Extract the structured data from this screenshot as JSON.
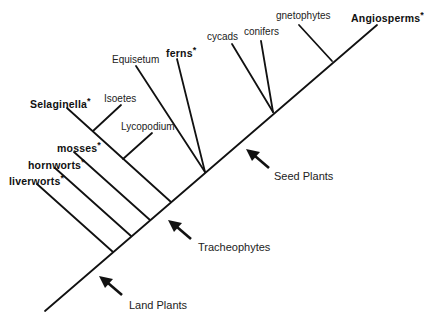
{
  "diagram": {
    "line_color": "#111111",
    "taxa": [
      {
        "id": "liverworts",
        "label": "liverworts",
        "bold": true,
        "asterisk": "*"
      },
      {
        "id": "hornworts",
        "label": "hornworts",
        "bold": true,
        "asterisk": "*"
      },
      {
        "id": "mosses",
        "label": "mosses",
        "bold": true,
        "asterisk": "*"
      },
      {
        "id": "selaginella",
        "label": "Selaginella",
        "bold": true,
        "asterisk": "*"
      },
      {
        "id": "isoetes",
        "label": "Isoetes",
        "bold": false,
        "asterisk": ""
      },
      {
        "id": "lycopodium",
        "label": "Lycopodium",
        "bold": false,
        "asterisk": ""
      },
      {
        "id": "equisetum",
        "label": "Equisetum",
        "bold": false,
        "asterisk": ""
      },
      {
        "id": "ferns",
        "label": "ferns",
        "bold": true,
        "asterisk": "*"
      },
      {
        "id": "cycads",
        "label": "cycads",
        "bold": false,
        "asterisk": ""
      },
      {
        "id": "conifers",
        "label": "conifers",
        "bold": false,
        "asterisk": ""
      },
      {
        "id": "gnetophytes",
        "label": "gnetophytes",
        "bold": false,
        "asterisk": ""
      },
      {
        "id": "angiosperms",
        "label": "Angiosperms",
        "bold": true,
        "asterisk": "*"
      }
    ],
    "groups": [
      {
        "id": "land-plants",
        "label": "Land Plants"
      },
      {
        "id": "tracheophytes",
        "label": "Tracheophytes"
      },
      {
        "id": "seed-plants",
        "label": "Seed Plants"
      }
    ]
  }
}
